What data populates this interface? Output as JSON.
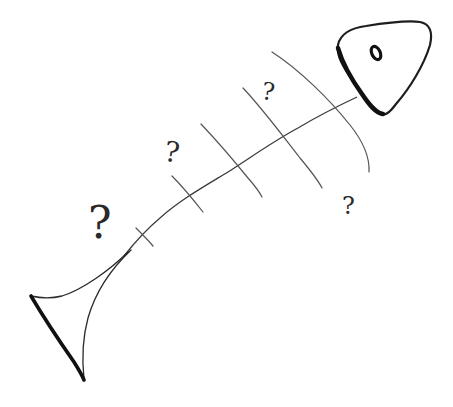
{
  "diagram": {
    "type": "fishbone-sketch",
    "colors": {
      "background": "#ffffff",
      "ink": "#1e1e1e",
      "rib_ink": "#555555"
    },
    "head": {
      "has_eye": true
    },
    "ribs_count": 5,
    "question_marks": [
      {
        "text": "?",
        "position": "upper-rib-gap"
      },
      {
        "text": "?",
        "position": "middle-upper"
      },
      {
        "text": "?",
        "position": "near-tail"
      },
      {
        "text": "?",
        "position": "lower-right"
      }
    ]
  }
}
